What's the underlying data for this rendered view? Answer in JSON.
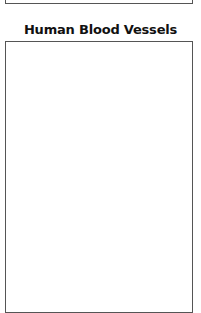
{
  "worksheet": {
    "title": "Human Blood Vessels"
  }
}
